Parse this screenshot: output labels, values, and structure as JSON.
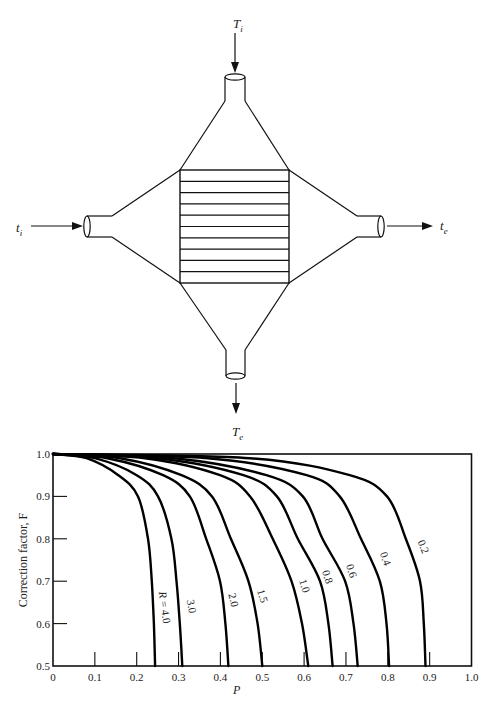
{
  "diagram": {
    "shell_inlet_label": "T",
    "shell_inlet_sub": "i",
    "shell_exit_label": "T",
    "shell_exit_sub": "e",
    "tube_inlet_label": "t",
    "tube_inlet_sub": "i",
    "tube_exit_label": "t",
    "tube_exit_sub": "e",
    "tube_count_lines": 10
  },
  "chart_data": {
    "type": "line",
    "title": "",
    "xlabel": "P",
    "ylabel": "Correction factor, F",
    "xlim": [
      0,
      1.0
    ],
    "ylim": [
      0.5,
      1.0
    ],
    "x_ticks": [
      "0",
      "0.1",
      "0.2",
      "0.3",
      "0.4",
      "0.5",
      "0.6",
      "0.7",
      "0.8",
      "0.9",
      "1.0"
    ],
    "y_ticks": [
      "0.5",
      "0.6",
      "0.7",
      "0.8",
      "0.9",
      "1.0"
    ],
    "grid": false,
    "legend": "inline curve labels",
    "series": [
      {
        "name": "R = 4.0",
        "label": "R = 4.0",
        "F": [
          1.0,
          0.99,
          0.95,
          0.9,
          0.8,
          0.7,
          0.6,
          0.5
        ],
        "P": [
          0,
          0.08,
          0.156,
          0.203,
          0.227,
          0.236,
          0.241,
          0.244
        ]
      },
      {
        "name": "3.0",
        "label": "3.0",
        "F": [
          1.0,
          0.99,
          0.95,
          0.9,
          0.8,
          0.7,
          0.6,
          0.5
        ],
        "P": [
          0,
          0.1,
          0.2,
          0.251,
          0.283,
          0.295,
          0.303,
          0.309
        ]
      },
      {
        "name": "2.0",
        "label": "2.0",
        "F": [
          1.0,
          0.99,
          0.95,
          0.9,
          0.8,
          0.7,
          0.6,
          0.5
        ],
        "P": [
          0,
          0.13,
          0.263,
          0.327,
          0.366,
          0.399,
          0.412,
          0.419
        ]
      },
      {
        "name": "1.5",
        "label": "1.5",
        "F": [
          1.0,
          0.99,
          0.95,
          0.9,
          0.8,
          0.7,
          0.6,
          0.5
        ],
        "P": [
          0,
          0.16,
          0.307,
          0.38,
          0.425,
          0.467,
          0.489,
          0.5
        ]
      },
      {
        "name": "1.0",
        "label": "1.0",
        "F": [
          1.0,
          0.99,
          0.95,
          0.9,
          0.8,
          0.7,
          0.6,
          0.5
        ],
        "P": [
          0,
          0.22,
          0.399,
          0.471,
          0.525,
          0.57,
          0.595,
          0.61
        ]
      },
      {
        "name": "0.8",
        "label": "0.8",
        "F": [
          1.0,
          0.99,
          0.95,
          0.9,
          0.8,
          0.7,
          0.6,
          0.5
        ],
        "P": [
          0,
          0.25,
          0.455,
          0.535,
          0.585,
          0.638,
          0.658,
          0.668
        ]
      },
      {
        "name": "0.6",
        "label": "0.6",
        "F": [
          1.0,
          0.99,
          0.95,
          0.9,
          0.8,
          0.7,
          0.6,
          0.5
        ],
        "P": [
          0,
          0.29,
          0.51,
          0.597,
          0.644,
          0.698,
          0.718,
          0.728
        ]
      },
      {
        "name": "0.4",
        "label": "0.4",
        "F": [
          1.0,
          0.99,
          0.95,
          0.9,
          0.8,
          0.7,
          0.6,
          0.5
        ],
        "P": [
          0,
          0.37,
          0.606,
          0.685,
          0.736,
          0.781,
          0.797,
          0.803
        ]
      },
      {
        "name": "0.2",
        "label": "0.2",
        "F": [
          1.0,
          0.99,
          0.95,
          0.9,
          0.8,
          0.7,
          0.6,
          0.5
        ],
        "P": [
          0,
          0.47,
          0.709,
          0.798,
          0.843,
          0.877,
          0.886,
          0.89
        ]
      }
    ],
    "label_positions": [
      {
        "x": 161,
        "y": 608,
        "rot": 82
      },
      {
        "x": 188,
        "y": 607,
        "rot": 80
      },
      {
        "x": 230,
        "y": 601,
        "rot": 76
      },
      {
        "x": 259,
        "y": 597,
        "rot": 74
      },
      {
        "x": 301,
        "y": 587,
        "rot": 72
      },
      {
        "x": 324,
        "y": 578,
        "rot": 72
      },
      {
        "x": 348,
        "y": 572,
        "rot": 72
      },
      {
        "x": 382,
        "y": 560,
        "rot": 70
      },
      {
        "x": 420,
        "y": 548,
        "rot": 68
      }
    ]
  }
}
